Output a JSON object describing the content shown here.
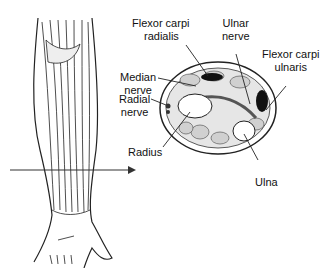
{
  "diagram": {
    "type": "anatomical illustration",
    "labels": {
      "flexor_carpi_radialis": "Flexor carpi\nradialis",
      "flexor_carpi_radialis_l1": "Flexor carpi",
      "flexor_carpi_radialis_l2": "radialis",
      "ulnar_nerve_l1": "Ulnar",
      "ulnar_nerve_l2": "nerve",
      "flexor_carpi_ulnaris_l1": "Flexor carpi",
      "flexor_carpi_ulnaris_l2": "ulnaris",
      "median_nerve_l1": "Median",
      "median_nerve_l2": "nerve",
      "radial_nerve_l1": "Radial",
      "radial_nerve_l2": "nerve",
      "radius": "Radius",
      "ulna": "Ulna"
    },
    "colors": {
      "line": "#222222",
      "fill": "#ffffff",
      "dark_structure": "#111111",
      "muscle": "#d9d9d9"
    }
  }
}
